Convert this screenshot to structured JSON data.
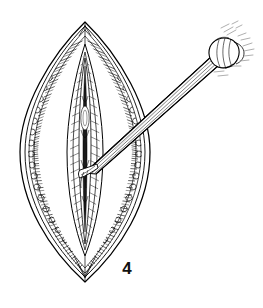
{
  "figure": {
    "label": "4",
    "domain": "line-art medical illustration",
    "background_color": "#ffffff",
    "ink_color": "#000000",
    "accent_gray": "#9a9a9a",
    "canvas": {
      "width": 263,
      "height": 308
    }
  },
  "scene": {
    "wound": {
      "name": "lenticular surgical incision",
      "top_apex": {
        "x": 85,
        "y": 22
      },
      "bottom_apex": {
        "x": 85,
        "y": 282
      },
      "left_extent_x": 19,
      "right_extent_x": 150,
      "widest_y": 152,
      "layers": [
        {
          "name": "outer-skin-contour",
          "description": "outermost thin ellipse outline of retracted skin"
        },
        {
          "name": "skin-edge-contour",
          "description": "second inner contour paralleling the skin margin"
        },
        {
          "name": "subcutaneous-fat-band",
          "description": "stippled beaded band of fat lobules between skin and muscle"
        },
        {
          "name": "muscle-hatching",
          "description": "dense radial hatch lines representing cut muscle fibers"
        },
        {
          "name": "inner-wound-flaps",
          "description": "paired inner tissue flaps flanking the deep incision"
        },
        {
          "name": "deep-incision-slit",
          "description": "narrow dark central slit at the depth of the wound"
        }
      ]
    },
    "instrument": {
      "name": "dissecting elevator",
      "shaft": {
        "from": {
          "x": 214,
          "y": 60
        },
        "to": {
          "x": 86,
          "y": 172
        }
      },
      "tip_location": {
        "x": 86,
        "y": 172
      },
      "hub": {
        "x": 219,
        "y": 50,
        "description": "knurled collar / handle hub at proximal end"
      },
      "motion_marks": {
        "description": "light gray dashed hatch strokes near the hub indicating highlight"
      }
    }
  },
  "caption": {
    "number": "4"
  }
}
